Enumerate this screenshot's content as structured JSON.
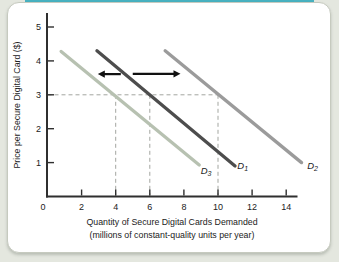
{
  "page": {
    "background": "#e4e7df",
    "top_strip_color": "#47b1c0",
    "card_background": "#ffffff",
    "card_border": "#c6cabf"
  },
  "chart_data": {
    "type": "line",
    "title": "",
    "ylabel": "Price per Secure Digital Card ($)",
    "xlabel_line1": "Quantity of Secure Digital Cards Demanded",
    "xlabel_line2": "(millions of constant-quality units per year)",
    "x_ticks": [
      0,
      2,
      4,
      6,
      8,
      10,
      12,
      14
    ],
    "y_ticks": [
      1,
      2,
      3,
      4,
      5
    ],
    "xlim": [
      0,
      14.6
    ],
    "ylim": [
      0,
      5.4
    ],
    "axis_color": "#2f2f2f",
    "text_color": "#222222",
    "series": [
      {
        "name": "D3",
        "label": "D",
        "sublabel": "3",
        "color": "#b7c1b1",
        "points": [
          [
            0.8,
            4.28
          ],
          [
            8.9,
            0.93
          ]
        ],
        "label_pos": [
          9.3,
          0.66
        ],
        "price3_quantity": 4
      },
      {
        "name": "D1",
        "label": "D",
        "sublabel": "1",
        "color": "#4d4d4d",
        "points": [
          [
            2.9,
            4.3
          ],
          [
            11.0,
            0.9
          ]
        ],
        "label_pos": [
          11.45,
          0.82
        ],
        "price3_quantity": 6
      },
      {
        "name": "D2",
        "label": "D",
        "sublabel": "2",
        "color": "#9b9b9b",
        "points": [
          [
            6.9,
            4.3
          ],
          [
            14.9,
            1.0
          ]
        ],
        "label_pos": [
          15.55,
          0.82
        ],
        "price3_quantity": 10
      }
    ],
    "guides": {
      "price": 3,
      "quantities": [
        4,
        6,
        10
      ],
      "extend_to_quantity": 10,
      "color": "#a3a6a0"
    },
    "arrows": [
      {
        "name": "shift-left-arrow",
        "direction": "left",
        "price": 3.61,
        "from_q": 4.3,
        "to_q": 2.95
      },
      {
        "name": "shift-right-arrow",
        "direction": "right",
        "price": 3.62,
        "from_q": 5.0,
        "to_q": 7.8
      }
    ],
    "arrow_color": "#111111"
  }
}
